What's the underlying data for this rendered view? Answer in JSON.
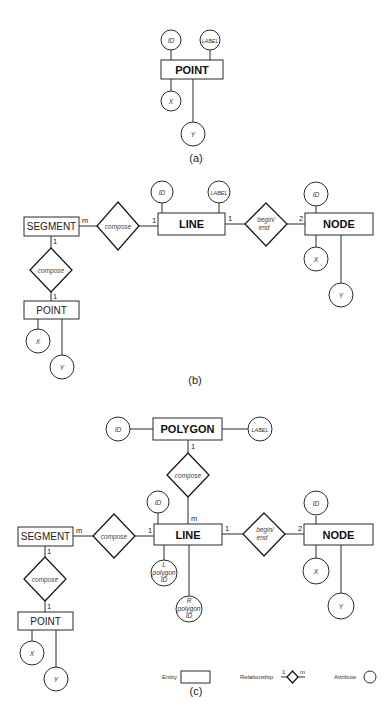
{
  "diagram_a": {
    "caption": "(a)",
    "entity": "POINT",
    "attributes": {
      "id": "ID",
      "label": "LABEL",
      "x": "X",
      "y": "Y"
    }
  },
  "diagram_b": {
    "caption": "(b)",
    "entities": {
      "segment": "SEGMENT",
      "line": "LINE",
      "node": "NODE",
      "point": "POINT"
    },
    "relationships": {
      "segment_line": {
        "label": "compose",
        "left_card": "m",
        "right_card": "1"
      },
      "line_node": {
        "label_line1": "begin/",
        "label_line2": "end",
        "left_card": "1",
        "right_card": "2"
      },
      "segment_point": {
        "label": "compose",
        "top_card": "1",
        "bottom_card": "1"
      }
    },
    "attributes": {
      "line_id": "ID",
      "line_label": "LABEL",
      "node_id": "ID",
      "node_x": "X",
      "node_y": "Y",
      "point_x": "X",
      "point_y": "Y"
    }
  },
  "diagram_c": {
    "caption": "(c)",
    "entities": {
      "polygon": "POLYGON",
      "segment": "SEGMENT",
      "line": "LINE",
      "node": "NODE",
      "point": "POINT"
    },
    "relationships": {
      "polygon_line": {
        "label": "compose",
        "top_card": "1",
        "bottom_card": "m"
      },
      "segment_line": {
        "label": "compose",
        "left_card": "m",
        "right_card": "1"
      },
      "line_node": {
        "label_line1": "begin/",
        "label_line2": "end",
        "left_card": "1",
        "right_card": "2"
      },
      "segment_point": {
        "label": "compose",
        "top_card": "1",
        "bottom_card": "1"
      }
    },
    "attributes": {
      "polygon_id": "ID",
      "polygon_label": "LABEL",
      "line_id": "ID",
      "l_polygon_id": [
        "L",
        "polygon",
        "ID"
      ],
      "r_polygon_id": [
        "R",
        "polygon",
        "ID"
      ],
      "node_id": "ID",
      "node_x": "X",
      "node_y": "Y",
      "point_x": "X",
      "point_y": "Y"
    }
  },
  "legend": {
    "entity": "Entity",
    "relationship": "Relationship",
    "relationship_left_card": "1",
    "relationship_right_card": "m",
    "attribute": "Attribute"
  }
}
